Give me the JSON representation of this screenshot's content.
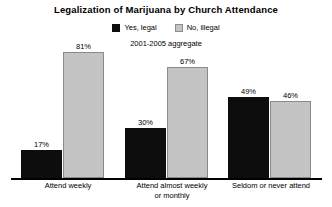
{
  "chart_data": {
    "type": "bar",
    "title": "Legalization of Marijuana by Church Attendance",
    "subtitle": "2001-2005 aggregate",
    "xlabel": "",
    "ylabel": "",
    "ylim": [
      0,
      100
    ],
    "grid": false,
    "legend_position": "top-center",
    "categories": [
      "Attend weekly",
      "Attend almost weekly or monthly",
      "Seldom or never attend"
    ],
    "category_lines": [
      [
        "Attend weekly"
      ],
      [
        "Attend almost weekly",
        "or monthly"
      ],
      [
        "Seldom or never attend"
      ]
    ],
    "series": [
      {
        "name": "Yes, legal",
        "color": "#0d0d0d",
        "values": [
          17,
          30,
          49
        ],
        "labels": [
          "17%",
          "30%",
          "49%"
        ]
      },
      {
        "name": "No, illegal",
        "color": "#c4c4c4",
        "values": [
          81,
          67,
          46
        ],
        "labels": [
          "81%",
          "67%",
          "46%"
        ]
      }
    ]
  },
  "legend": {
    "entries": [
      {
        "label": "Yes, legal"
      },
      {
        "label": "No, illegal"
      }
    ]
  }
}
